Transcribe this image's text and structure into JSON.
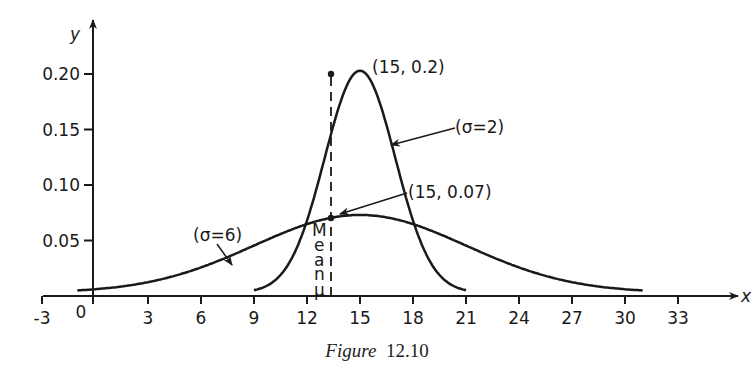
{
  "chart_data": {
    "type": "line",
    "title": "",
    "caption": {
      "prefix": "Figure",
      "number": "12.10"
    },
    "xlabel": "x",
    "ylabel": "y",
    "xlim": [
      -3,
      35
    ],
    "ylim": [
      0,
      0.22
    ],
    "x_ticks": [
      -3,
      0,
      3,
      6,
      9,
      12,
      15,
      18,
      21,
      24,
      27,
      30,
      33
    ],
    "x_tick_labels": [
      "-3",
      "0",
      "3",
      "6",
      "9",
      "12",
      "15",
      "18",
      "21",
      "24",
      "27",
      "30",
      "33"
    ],
    "y_ticks": [
      0.05,
      0.1,
      0.15,
      0.2
    ],
    "y_tick_labels": [
      "0.05",
      "0.10",
      "0.15",
      "0.20"
    ],
    "grid": false,
    "series": [
      {
        "name": "(σ=2)",
        "mean": 15,
        "sigma": 2,
        "x_range": [
          9,
          21
        ],
        "peak": [
          15,
          0.2
        ]
      },
      {
        "name": "(σ=6)",
        "mean": 15,
        "sigma": 6,
        "x_range": [
          -1,
          31
        ],
        "peak": [
          15,
          0.07
        ]
      }
    ],
    "annotations": [
      {
        "text": "(15, 0.2)",
        "x": 15,
        "y": 0.2
      },
      {
        "text": "(15, 0.07)",
        "x": 15,
        "y": 0.07
      },
      {
        "text": "(σ=2)",
        "target": "σ=2 curve"
      },
      {
        "text": "(σ=6)",
        "target": "σ=6 curve"
      },
      {
        "text": "Mean μ",
        "orientation": "vertical",
        "x": 15
      }
    ],
    "mean_line": {
      "x": 15,
      "style": "dashed"
    }
  },
  "labels": {
    "y_axis": "y",
    "x_axis": "x",
    "peak_high": "(15, 0.2)",
    "peak_low": "(15, 0.07)",
    "sigma2": "(σ=2)",
    "sigma6": "(σ=6)",
    "mean_letters": [
      "M",
      "e",
      "a",
      "n",
      "μ"
    ],
    "caption_prefix": "Figure",
    "caption_number": "12.10"
  }
}
